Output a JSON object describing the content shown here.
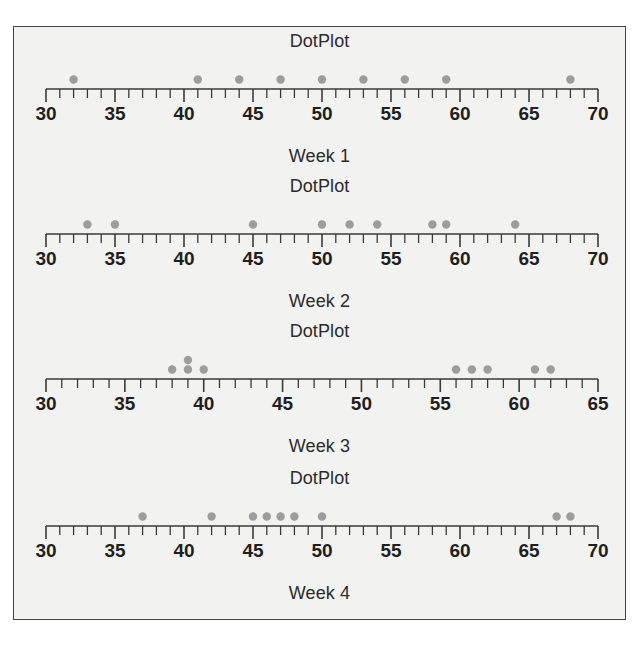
{
  "figure": {
    "background_color": "#f2f2f0",
    "border_color": "#444444",
    "dot_color": "#9d9d9d",
    "axis_color": "#3a3a3a"
  },
  "chart_data": [
    {
      "type": "scatter",
      "title": "DotPlot",
      "xlabel": "Week 1",
      "ylabel": "",
      "xlim": [
        30,
        70
      ],
      "major_tick_step": 5,
      "minor_tick_step": 1,
      "tick_labels": [
        "30",
        "35",
        "40",
        "45",
        "50",
        "55",
        "60",
        "65",
        "70"
      ],
      "grid": false,
      "values": [
        32,
        41,
        44,
        47,
        50,
        53,
        56,
        59,
        68
      ]
    },
    {
      "type": "scatter",
      "title": "DotPlot",
      "xlabel": "Week 2",
      "ylabel": "",
      "xlim": [
        30,
        70
      ],
      "major_tick_step": 5,
      "minor_tick_step": 1,
      "tick_labels": [
        "30",
        "35",
        "40",
        "45",
        "50",
        "55",
        "60",
        "65",
        "70"
      ],
      "grid": false,
      "values": [
        33,
        35,
        45,
        50,
        52,
        54,
        58,
        59,
        64
      ]
    },
    {
      "type": "scatter",
      "title": "DotPlot",
      "xlabel": "Week 3",
      "ylabel": "",
      "xlim": [
        30,
        65
      ],
      "major_tick_step": 5,
      "minor_tick_step": 1,
      "tick_labels": [
        "30",
        "35",
        "40",
        "45",
        "50",
        "55",
        "60",
        "65"
      ],
      "grid": false,
      "values": [
        38,
        39,
        39,
        40,
        56,
        57,
        58,
        61,
        62
      ]
    },
    {
      "type": "scatter",
      "title": "DotPlot",
      "xlabel": "Week 4",
      "ylabel": "",
      "xlim": [
        30,
        70
      ],
      "major_tick_step": 5,
      "minor_tick_step": 1,
      "tick_labels": [
        "30",
        "35",
        "40",
        "45",
        "50",
        "55",
        "60",
        "65",
        "70"
      ],
      "grid": false,
      "values": [
        37,
        42,
        45,
        46,
        47,
        48,
        50,
        67,
        68
      ]
    }
  ]
}
